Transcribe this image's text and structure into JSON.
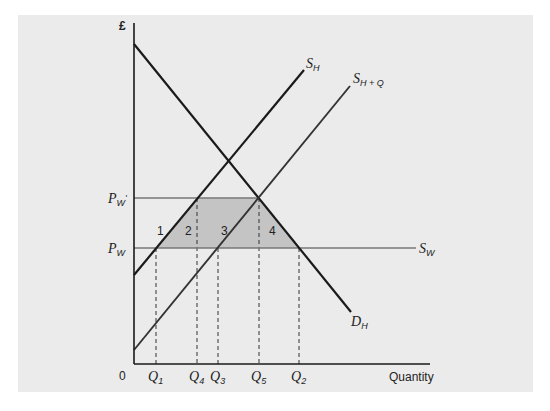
{
  "chart_data": {
    "type": "line",
    "title": "",
    "xlabel": "Quantity",
    "ylabel": "£",
    "origin_label": "0",
    "colors": {
      "panel": "#ebebeb",
      "lines": "#1a1a1a",
      "world_price_lines": "#777777",
      "shaded_area": "#c4c4c4"
    },
    "series": [
      {
        "name": "D_H",
        "label_main": "D",
        "label_sub": "H",
        "kind": "demand",
        "points": [
          [
            134,
            44
          ],
          [
            351,
            312
          ]
        ]
      },
      {
        "name": "S_H",
        "label_main": "S",
        "label_sub": "H",
        "kind": "domestic supply",
        "points": [
          [
            134,
            275
          ],
          [
            304,
            70
          ]
        ]
      },
      {
        "name": "S_H+Q",
        "label_main": "S",
        "label_sub": "H + Q",
        "kind": "domestic supply plus quota",
        "points": [
          [
            134,
            350
          ],
          [
            350,
            86
          ]
        ]
      },
      {
        "name": "S_W",
        "label_main": "S",
        "label_sub": "W",
        "kind": "world supply",
        "points": [
          [
            134,
            248
          ],
          [
            416,
            248
          ]
        ]
      }
    ],
    "price_levels": [
      {
        "name": "P_W'",
        "label_main": "P",
        "label_sub": "W",
        "prime": "'",
        "y": 198,
        "x_end": 259
      },
      {
        "name": "P_W",
        "label_main": "P",
        "label_sub": "W",
        "prime": "",
        "y": 248,
        "x_end": 416
      }
    ],
    "quantity_markers": [
      {
        "name": "Q1",
        "label_main": "Q",
        "label_sub": "1",
        "x": 156,
        "y_top": 248
      },
      {
        "name": "Q4",
        "label_main": "Q",
        "label_sub": "4",
        "x": 197,
        "y_top": 198
      },
      {
        "name": "Q3",
        "label_main": "Q",
        "label_sub": "3",
        "x": 218,
        "y_top": 248
      },
      {
        "name": "Q5",
        "label_main": "Q",
        "label_sub": "5",
        "x": 259,
        "y_top": 198
      },
      {
        "name": "Q2",
        "label_main": "Q",
        "label_sub": "2",
        "x": 299,
        "y_top": 248
      }
    ],
    "shaded_region": {
      "points": [
        [
          156,
          248
        ],
        [
          197,
          198
        ],
        [
          259,
          198
        ],
        [
          299,
          248
        ]
      ]
    },
    "region_labels": [
      {
        "text": "1",
        "x": 157,
        "y": 235
      },
      {
        "text": "2",
        "x": 185,
        "y": 235
      },
      {
        "text": "3",
        "x": 221,
        "y": 235
      },
      {
        "text": "4",
        "x": 269,
        "y": 235
      }
    ],
    "axes": {
      "origin": [
        134,
        364
      ],
      "y_top": 23,
      "x_end": 430
    }
  }
}
